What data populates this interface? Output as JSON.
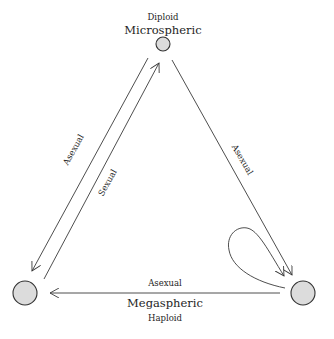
{
  "nodes": {
    "top": {
      "name": "Microspheric",
      "ploidy": "Diploid"
    },
    "bottom_right": {
      "name": "Megaspheric",
      "ploidy": "Haploid"
    },
    "bottom_left": {
      "name": ""
    }
  },
  "edges": {
    "top_to_left": {
      "label": "Asexual"
    },
    "left_to_top": {
      "label": "Sexual"
    },
    "top_to_right": {
      "label": "Asexual"
    },
    "right_to_left": {
      "label": "Asexual"
    },
    "right_self_loop": {
      "label": ""
    }
  },
  "colors": {
    "node_fill": "#dcdcdc",
    "node_stroke": "#333333",
    "line": "#3a3a3a",
    "text": "#1e1e1e"
  }
}
